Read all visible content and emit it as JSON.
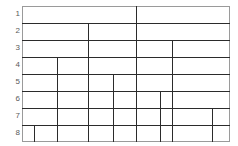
{
  "diagram": {
    "kind": "fraction-strip-partition-diagram",
    "title": "",
    "colors": {
      "divider": "#2b2b2b",
      "frame": "#9a9a9a",
      "label_text": "#5a5a5a",
      "background": "#ffffff"
    },
    "geometry": {
      "grid_left": 22,
      "grid_right": 230,
      "grid_top": 6,
      "grid_bottom": 142,
      "grid_width": 208,
      "row_height": 17,
      "row_boundaries_y": [
        6,
        23,
        40,
        57,
        74,
        91,
        108,
        125,
        142
      ]
    },
    "row_labels": [
      "1",
      "2",
      "3",
      "4",
      "5",
      "6",
      "7",
      "8"
    ],
    "rows": [
      {
        "label": "1",
        "index": 1,
        "cell_count": 2,
        "top": 6,
        "bottom": 23,
        "divider_x": [
          136
        ]
      },
      {
        "label": "2",
        "index": 2,
        "cell_count": 3,
        "top": 23,
        "bottom": 40,
        "divider_x": [
          88,
          136
        ]
      },
      {
        "label": "3",
        "index": 3,
        "cell_count": 4,
        "top": 40,
        "bottom": 57,
        "divider_x": [
          88,
          136,
          172
        ]
      },
      {
        "label": "4",
        "index": 4,
        "cell_count": 5,
        "top": 57,
        "bottom": 74,
        "divider_x": [
          57,
          88,
          136,
          172
        ]
      },
      {
        "label": "5",
        "index": 5,
        "cell_count": 6,
        "top": 74,
        "bottom": 91,
        "divider_x": [
          57,
          88,
          113,
          136,
          172
        ]
      },
      {
        "label": "6",
        "index": 6,
        "cell_count": 7,
        "top": 91,
        "bottom": 108,
        "divider_x": [
          57,
          88,
          113,
          136,
          160,
          172
        ]
      },
      {
        "label": "7",
        "index": 7,
        "cell_count": 8,
        "top": 108,
        "bottom": 125,
        "divider_x": [
          57,
          88,
          113,
          136,
          160,
          172,
          212
        ]
      },
      {
        "label": "8",
        "index": 8,
        "cell_count": 9,
        "top": 125,
        "bottom": 142,
        "divider_x": [
          34,
          57,
          88,
          113,
          136,
          160,
          172,
          212
        ]
      }
    ]
  }
}
